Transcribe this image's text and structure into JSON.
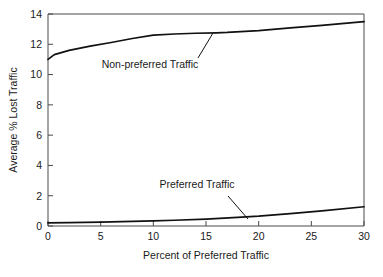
{
  "chart_data": {
    "type": "line",
    "title": "",
    "subtitle": "",
    "xlabel": "Percent of Preferred Traffic",
    "ylabel": "Average % Lost Traffic",
    "xlim": [
      0,
      30
    ],
    "ylim": [
      0,
      14
    ],
    "xticks": [
      0,
      5,
      10,
      15,
      20,
      25,
      30
    ],
    "yticks": [
      0,
      2,
      4,
      6,
      8,
      10,
      12,
      14
    ],
    "xtick_labels": [
      "0",
      "5",
      "10",
      "15",
      "20",
      "25",
      "30"
    ],
    "ytick_labels": [
      "0",
      "2",
      "4",
      "6",
      "8",
      "10",
      "12",
      "14"
    ],
    "grid": false,
    "legend": "none (inline annotations)",
    "line_color": "#111111",
    "frame_color": "#4a4a4a",
    "series": [
      {
        "name": "Non-preferred Traffic",
        "x": [
          0,
          0.6,
          2,
          4,
          6,
          8,
          10,
          12,
          14,
          16,
          17,
          20,
          23,
          26,
          30
        ],
        "values": [
          11.0,
          11.32,
          11.6,
          11.88,
          12.12,
          12.38,
          12.6,
          12.68,
          12.73,
          12.76,
          12.78,
          12.9,
          13.08,
          13.25,
          13.5
        ]
      },
      {
        "name": "Preferred Traffic",
        "x": [
          0,
          2,
          5,
          8,
          10,
          12,
          15,
          18,
          20,
          23,
          26,
          30
        ],
        "values": [
          0.2,
          0.22,
          0.26,
          0.31,
          0.34,
          0.38,
          0.46,
          0.57,
          0.65,
          0.82,
          1.0,
          1.27
        ]
      }
    ],
    "annotations": [
      {
        "label": "Non-preferred Traffic",
        "text_x": 150,
        "text_y": 68,
        "leader_from_x": 198,
        "leader_from_y": 58,
        "leader_to_x": 213,
        "leader_to_y": 33
      },
      {
        "label": "Preferred Traffic",
        "text_x": 197,
        "text_y": 188,
        "leader_from_x": 228,
        "leader_from_y": 196,
        "leader_to_x": 248,
        "leader_to_y": 219
      }
    ]
  }
}
